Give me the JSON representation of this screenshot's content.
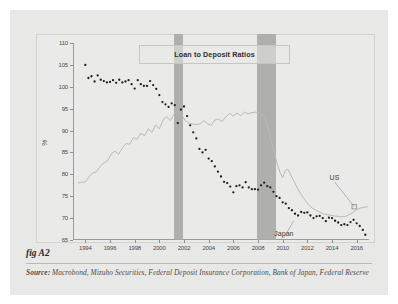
{
  "figure": {
    "fig_label": "fig A2",
    "source_label": "Source:",
    "source_text": "Macrobond, Mizuho Securities, Federal Deposit Insurance Corporation, Bank of Japan, Federal Reserve"
  },
  "colors": {
    "card_background": "#e8e8e6",
    "panel_background": "#eaeae8",
    "axis": "#9a9a98",
    "us_series": "#1f1f1f",
    "japan_series": "#b9b9b6",
    "recession_band": "#a9a9a6",
    "title_border": "#c6c6c3"
  },
  "chart_data": {
    "type": "scatter",
    "title": "Loan to Deposit Ratios",
    "xlabel": "",
    "ylabel": "%",
    "xlim": [
      1993.0,
      2017.0
    ],
    "ylim": [
      65,
      110
    ],
    "ytick_values": [
      65,
      70,
      75,
      80,
      85,
      90,
      95,
      100,
      105,
      110
    ],
    "ytick_labels": [
      "65",
      "70",
      "75",
      "80",
      "85",
      "90",
      "95",
      "100",
      "105",
      "110"
    ],
    "xtick_values": [
      1994,
      1996,
      1998,
      2000,
      2002,
      2004,
      2006,
      2008,
      2010,
      2012,
      2014,
      2016
    ],
    "xtick_labels": [
      "1994",
      "1996",
      "1998",
      "2000",
      "2002",
      "2004",
      "2006",
      "2008",
      "2010",
      "2012",
      "2014",
      "2016"
    ],
    "grid": false,
    "legend_position": "inline-annotations",
    "annotations": [
      {
        "name": "us-annotation",
        "text": "US",
        "x": 2014.2,
        "y": 79.0,
        "point_x": 2015.8,
        "point_y": 72.6,
        "marker": "open-square"
      },
      {
        "name": "japan-annotation",
        "text": "Japan",
        "x": 2010.1,
        "y": 66.2,
        "point_x": 2010.9,
        "point_y": 69.4,
        "marker": "none"
      }
    ],
    "shaded_regions": [
      {
        "name": "recession-2001",
        "x_start": 2001.2,
        "x_end": 2001.95,
        "label": ""
      },
      {
        "name": "recession-2008",
        "x_start": 2007.95,
        "x_end": 2009.5,
        "label": ""
      }
    ],
    "series": [
      {
        "name": "US",
        "style": "dotted",
        "color": "#1f1f1f",
        "points": [
          [
            1994.0,
            105.0
          ],
          [
            1994.25,
            102.0
          ],
          [
            1994.5,
            102.4
          ],
          [
            1994.75,
            101.2
          ],
          [
            1995.0,
            102.6
          ],
          [
            1995.25,
            101.6
          ],
          [
            1995.5,
            101.3
          ],
          [
            1995.75,
            101.0
          ],
          [
            1996.0,
            101.1
          ],
          [
            1996.25,
            101.5
          ],
          [
            1996.5,
            100.9
          ],
          [
            1996.75,
            101.6
          ],
          [
            1997.0,
            101.0
          ],
          [
            1997.25,
            101.2
          ],
          [
            1997.5,
            101.5
          ],
          [
            1997.75,
            100.6
          ],
          [
            1998.0,
            99.6
          ],
          [
            1998.25,
            101.5
          ],
          [
            1998.5,
            100.6
          ],
          [
            1998.75,
            100.2
          ],
          [
            1999.0,
            100.2
          ],
          [
            1999.25,
            101.3
          ],
          [
            1999.5,
            100.4
          ],
          [
            1999.75,
            99.5
          ],
          [
            2000.0,
            98.1
          ],
          [
            2000.25,
            96.5
          ],
          [
            2000.5,
            96.0
          ],
          [
            2000.75,
            95.4
          ],
          [
            2001.0,
            96.2
          ],
          [
            2001.25,
            95.8
          ],
          [
            2001.5,
            91.7
          ],
          [
            2001.75,
            94.8
          ],
          [
            2002.0,
            95.5
          ],
          [
            2002.25,
            93.3
          ],
          [
            2002.5,
            91.2
          ],
          [
            2002.75,
            89.6
          ],
          [
            2003.0,
            88.2
          ],
          [
            2003.25,
            85.8
          ],
          [
            2003.5,
            85.0
          ],
          [
            2003.75,
            85.6
          ],
          [
            2004.0,
            83.6
          ],
          [
            2004.25,
            83.0
          ],
          [
            2004.5,
            81.8
          ],
          [
            2004.75,
            80.6
          ],
          [
            2005.0,
            79.5
          ],
          [
            2005.25,
            78.3
          ],
          [
            2005.5,
            78.0
          ],
          [
            2005.75,
            77.2
          ],
          [
            2006.0,
            75.9
          ],
          [
            2006.25,
            77.3
          ],
          [
            2006.5,
            77.5
          ],
          [
            2006.75,
            77.0
          ],
          [
            2007.0,
            78.2
          ],
          [
            2007.25,
            77.0
          ],
          [
            2007.5,
            76.6
          ],
          [
            2007.75,
            76.6
          ],
          [
            2008.0,
            76.5
          ],
          [
            2008.25,
            77.5
          ],
          [
            2008.5,
            78.1
          ],
          [
            2008.75,
            77.3
          ],
          [
            2009.0,
            77.0
          ],
          [
            2009.25,
            76.0
          ],
          [
            2009.5,
            75.0
          ],
          [
            2009.75,
            74.6
          ],
          [
            2010.0,
            73.6
          ],
          [
            2010.25,
            73.3
          ],
          [
            2010.5,
            72.3
          ],
          [
            2010.75,
            71.8
          ],
          [
            2011.0,
            71.0
          ],
          [
            2011.25,
            70.6
          ],
          [
            2011.5,
            71.4
          ],
          [
            2011.75,
            71.2
          ],
          [
            2012.0,
            71.3
          ],
          [
            2012.25,
            70.6
          ],
          [
            2012.5,
            70.0
          ],
          [
            2012.75,
            70.4
          ],
          [
            2013.0,
            70.5
          ],
          [
            2013.25,
            70.0
          ],
          [
            2013.5,
            69.3
          ],
          [
            2013.75,
            70.1
          ],
          [
            2014.0,
            70.0
          ],
          [
            2014.25,
            69.4
          ],
          [
            2014.5,
            69.0
          ],
          [
            2014.75,
            68.4
          ],
          [
            2015.0,
            68.6
          ],
          [
            2015.25,
            68.4
          ],
          [
            2015.5,
            69.1
          ],
          [
            2015.75,
            69.6
          ],
          [
            2016.0,
            68.8
          ],
          [
            2016.25,
            68.2
          ],
          [
            2016.5,
            67.3
          ],
          [
            2016.7,
            66.2
          ]
        ]
      },
      {
        "name": "Japan",
        "style": "line",
        "color": "#b9b9b6",
        "points": [
          [
            1993.4,
            78.0
          ],
          [
            1993.7,
            78.2
          ],
          [
            1994.0,
            78.3
          ],
          [
            1994.3,
            79.4
          ],
          [
            1994.6,
            80.3
          ],
          [
            1994.9,
            80.6
          ],
          [
            1995.2,
            81.8
          ],
          [
            1995.5,
            82.6
          ],
          [
            1995.8,
            83.1
          ],
          [
            1996.1,
            84.6
          ],
          [
            1996.4,
            85.3
          ],
          [
            1996.7,
            84.6
          ],
          [
            1997.0,
            86.0
          ],
          [
            1997.3,
            87.0
          ],
          [
            1997.6,
            86.9
          ],
          [
            1997.9,
            88.4
          ],
          [
            1998.2,
            88.0
          ],
          [
            1998.5,
            89.4
          ],
          [
            1998.8,
            88.8
          ],
          [
            1999.1,
            90.4
          ],
          [
            1999.4,
            89.6
          ],
          [
            1999.7,
            91.3
          ],
          [
            2000.0,
            90.4
          ],
          [
            2000.3,
            92.4
          ],
          [
            2000.6,
            93.2
          ],
          [
            2000.9,
            92.3
          ],
          [
            2001.2,
            93.8
          ],
          [
            2001.5,
            94.6
          ],
          [
            2001.8,
            93.6
          ],
          [
            2002.1,
            92.3
          ],
          [
            2002.4,
            91.7
          ],
          [
            2002.7,
            91.5
          ],
          [
            2003.0,
            91.4
          ],
          [
            2003.3,
            91.5
          ],
          [
            2003.6,
            92.3
          ],
          [
            2003.9,
            91.6
          ],
          [
            2004.2,
            91.2
          ],
          [
            2004.5,
            92.4
          ],
          [
            2004.8,
            92.6
          ],
          [
            2005.1,
            92.1
          ],
          [
            2005.4,
            93.2
          ],
          [
            2005.7,
            93.9
          ],
          [
            2006.0,
            93.3
          ],
          [
            2006.3,
            94.0
          ],
          [
            2006.6,
            93.4
          ],
          [
            2006.9,
            94.2
          ],
          [
            2007.2,
            93.8
          ],
          [
            2007.5,
            94.1
          ],
          [
            2007.8,
            94.2
          ],
          [
            2008.1,
            94.1
          ],
          [
            2008.4,
            93.6
          ],
          [
            2008.7,
            92.0
          ],
          [
            2009.0,
            88.5
          ],
          [
            2009.3,
            85.0
          ],
          [
            2009.6,
            82.0
          ],
          [
            2009.8,
            80.4
          ],
          [
            2010.0,
            79.2
          ],
          [
            2010.2,
            80.8
          ],
          [
            2010.4,
            81.2
          ],
          [
            2010.6,
            80.2
          ],
          [
            2010.9,
            78.5
          ],
          [
            2011.2,
            76.8
          ],
          [
            2011.5,
            75.4
          ],
          [
            2011.8,
            74.2
          ],
          [
            2012.1,
            73.0
          ],
          [
            2012.4,
            72.3
          ],
          [
            2012.7,
            71.8
          ],
          [
            2013.0,
            71.4
          ],
          [
            2013.3,
            71.0
          ],
          [
            2013.6,
            70.8
          ],
          [
            2013.9,
            70.6
          ],
          [
            2014.2,
            70.5
          ],
          [
            2014.5,
            70.4
          ],
          [
            2014.8,
            70.3
          ],
          [
            2015.1,
            70.4
          ],
          [
            2015.4,
            70.8
          ],
          [
            2015.7,
            71.3
          ],
          [
            2016.0,
            71.9
          ],
          [
            2016.3,
            72.3
          ],
          [
            2016.6,
            72.5
          ],
          [
            2016.9,
            72.6
          ]
        ]
      }
    ]
  }
}
